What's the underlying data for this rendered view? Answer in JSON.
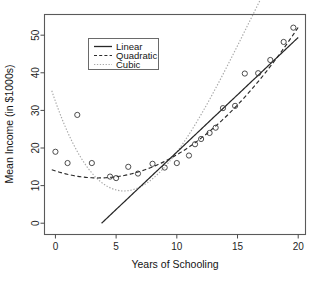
{
  "chart_data": {
    "type": "scatter",
    "title": "",
    "xlabel": "Years of Schooling",
    "ylabel": "Mean Income (in $1000s)",
    "xlim": [
      -0.9,
      20.6
    ],
    "ylim": [
      -3.0,
      55.5
    ],
    "xticks": [
      0,
      5,
      10,
      15,
      20
    ],
    "xticklabels": [
      "0",
      "5",
      "10",
      "15",
      "20"
    ],
    "yticks": [
      0,
      10,
      20,
      30,
      40,
      50
    ],
    "yticklabels": [
      "0",
      "10",
      "20",
      "30",
      "40",
      "50"
    ],
    "grid": false,
    "legend_position": "upper-left-inside",
    "points": {
      "marker": "open-circle",
      "x": [
        0.0,
        1.0,
        1.8,
        3.0,
        4.5,
        5.0,
        6.0,
        6.8,
        8.0,
        9.0,
        10.0,
        11.0,
        11.5,
        12.0,
        12.7,
        13.2,
        13.8,
        14.8,
        15.6,
        16.7,
        17.7,
        18.8,
        19.6
      ],
      "y": [
        19.0,
        16.0,
        28.8,
        16.0,
        12.4,
        12.0,
        15.0,
        13.2,
        15.8,
        14.8,
        16.0,
        18.0,
        21.0,
        22.4,
        24.0,
        25.4,
        30.6,
        31.2,
        39.8,
        39.9,
        43.4,
        48.2,
        52.0
      ]
    },
    "series": [
      {
        "name": "Linear",
        "style": "solid",
        "color": "#272727",
        "model": "linear",
        "coefficients": [
          -11.6,
          3.05
        ],
        "x_range": [
          3.8,
          20.0
        ]
      },
      {
        "name": "Quadratic",
        "style": "dashed",
        "color": "#2b2b2b",
        "model": "quadratic",
        "coefficients": [
          13.9,
          -1.05,
          0.148
        ],
        "x_range": [
          -0.3,
          20.0
        ]
      },
      {
        "name": "Cubic",
        "style": "dotted",
        "color": "#a8a8a8",
        "model": "cubic",
        "coefficients": [
          32.4,
          -9.1,
          0.98,
          -0.0205
        ],
        "x_range": [
          -0.3,
          20.0
        ]
      }
    ],
    "legend": {
      "entries": [
        {
          "label": "Linear",
          "style": "solid"
        },
        {
          "label": "Quadratic",
          "style": "dashed"
        },
        {
          "label": "Cubic",
          "style": "dotted"
        }
      ]
    }
  }
}
